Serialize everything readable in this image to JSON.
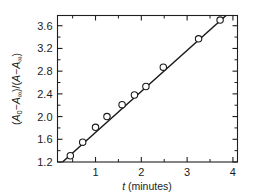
{
  "chart_data": {
    "type": "scatter",
    "title": "",
    "xlabel": "t (minutes)",
    "ylabel": "(A0 - A∞)/(A - A∞)",
    "ylabel_parts": {
      "open1": "(",
      "a1": "A",
      "a1_sub": "0",
      "minus1": "−",
      "a2": "A",
      "a2_sub": "∞",
      "close1": ")",
      "slash": "/",
      "open2": "(",
      "a3": "A",
      "minus2": "−",
      "a4": "A",
      "a4_sub": "∞",
      "close2": ")"
    },
    "xlabel_parts": {
      "symbol": "t",
      "unit": "(minutes)"
    },
    "xlim": [
      0.17,
      4.1
    ],
    "ylim": [
      1.2,
      3.78
    ],
    "grid": false,
    "legend": null,
    "x_ticks": [
      1,
      2,
      3,
      4
    ],
    "x_tick_labels": [
      "1",
      "2",
      "3",
      "4"
    ],
    "x_minor_ticks": [
      0.5,
      1.5,
      2.5,
      3.5
    ],
    "y_ticks": [
      1.2,
      1.6,
      2.0,
      2.4,
      2.8,
      3.2,
      3.6
    ],
    "y_tick_labels": [
      "1.2",
      "1.6",
      "2.0",
      "2.4",
      "2.8",
      "3.2",
      "3.6"
    ],
    "y_minor_ticks": [
      1.4,
      1.8,
      2.2,
      2.6,
      3.0,
      3.4
    ],
    "x": [
      0.45,
      0.72,
      1.0,
      1.25,
      1.58,
      1.85,
      2.1,
      2.48,
      3.25,
      3.72
    ],
    "values": [
      1.31,
      1.55,
      1.81,
      2.0,
      2.21,
      2.38,
      2.53,
      2.87,
      3.37,
      3.7
    ],
    "marker": "open-circle",
    "marker_size": 3.2,
    "fit_line": {
      "x": [
        0.28,
        3.85
      ],
      "y": [
        1.2,
        3.78
      ],
      "slope": 0.723,
      "intercept": 0.998
    },
    "colors": {
      "axis": "#1e1e1e",
      "line": "#1a1a1a",
      "marker_edge": "#1a1a1a",
      "marker_fill": "#ffffff",
      "background": "#ffffff",
      "text": "#1c1c1c"
    }
  }
}
